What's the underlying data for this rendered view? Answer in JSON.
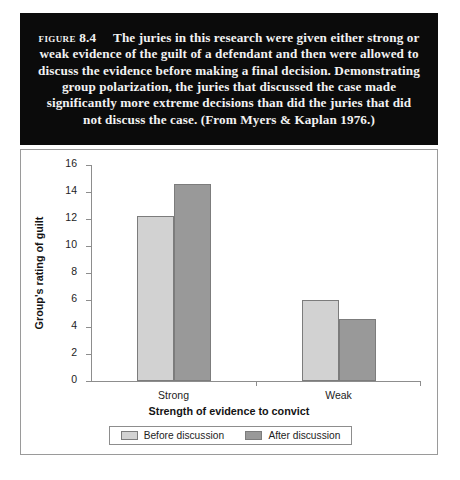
{
  "caption": {
    "figure_label": "Figure",
    "figure_number": "8.4",
    "body": "The juries in this research were given either strong or weak evidence of the guilt of a defendant and then were allowed to discuss the evidence before making a final decision. Demonstrating group polarization, the juries that discussed the case made significantly more extreme decisions than did the juries that did not discuss the case. (From Myers & Kaplan 1976.)"
  },
  "chart_data": {
    "type": "bar",
    "title": "",
    "subtitle": "",
    "categories": [
      "Strong",
      "Weak"
    ],
    "series": [
      {
        "name": "Before discussion",
        "values": [
          12.2,
          6.0
        ],
        "color": "#d2d2d2"
      },
      {
        "name": "After discussion",
        "values": [
          14.6,
          4.6
        ],
        "color": "#999999"
      }
    ],
    "xlabel": "Strength of evidence to convict",
    "ylabel": "Group's rating of guilt",
    "ylim": [
      0,
      16
    ],
    "ytick_step": 2,
    "yticks": [
      "0",
      "2",
      "4",
      "6",
      "8",
      "10",
      "12",
      "14",
      "16"
    ],
    "grid": false,
    "legend_position": "bottom"
  },
  "legend": {
    "items": [
      {
        "label": "Before discussion",
        "color": "#d2d2d2"
      },
      {
        "label": "After discussion",
        "color": "#999999"
      }
    ]
  },
  "colors": {
    "caption_background": "#0b0b0b",
    "caption_text": "#f2f2f2",
    "frame_border": "#9a9a9a",
    "axis": "#8d8d8d",
    "bar_before": "#d2d2d2",
    "bar_after": "#999999",
    "bar_border": "#7c7c7c",
    "text": "#1d1d1d"
  }
}
